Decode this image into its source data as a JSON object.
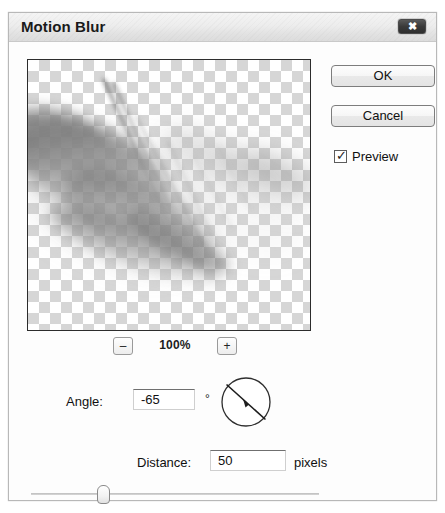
{
  "dialog": {
    "title": "Motion Blur",
    "close_icon": "close-icon",
    "close_glyph": "✖"
  },
  "preview": {
    "zoom_out_label": "–",
    "zoom_level": "100%",
    "zoom_in_label": "+",
    "canvas_description": "motion-blurred grayscale artwork on transparency checkerboard"
  },
  "buttons": {
    "ok_label": "OK",
    "cancel_label": "Cancel"
  },
  "preview_option": {
    "label": "Preview",
    "checked_glyph": "✓",
    "checked": true
  },
  "angle": {
    "label": "Angle:",
    "value": "-65",
    "unit_symbol": "°",
    "dial_degrees": -65
  },
  "distance": {
    "label": "Distance:",
    "value": "50",
    "unit_label": "pixels",
    "slider_percent": 24
  },
  "colors": {
    "titlebar_top": "#f4f4f4",
    "titlebar_bottom": "#dcdcdc",
    "dialog_background": "#fdfdfd",
    "border": "#b8b8b8",
    "close_button": "#3a3a3a",
    "text": "#101010",
    "checker_light": "#ffffff",
    "checker_dark": "#d6d6d6"
  }
}
